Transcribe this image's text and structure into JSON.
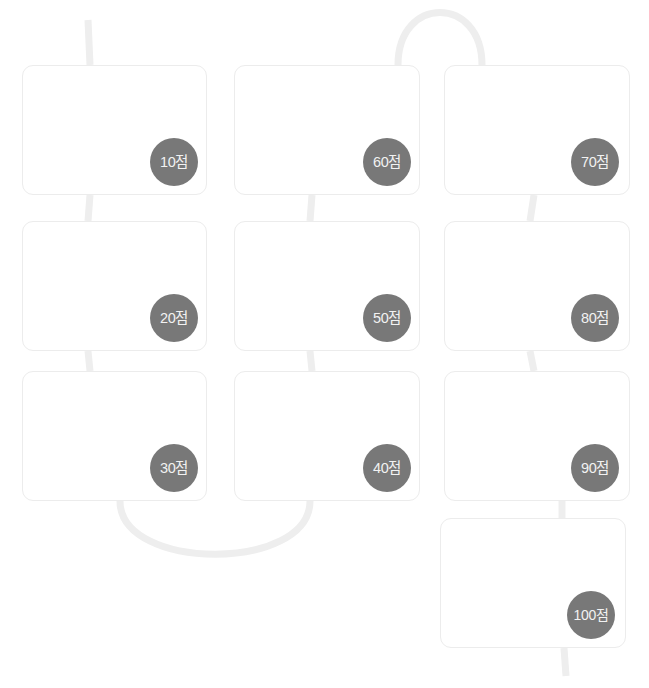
{
  "board": {
    "title": "score-card-flow-board",
    "colors": {
      "card_background": "#ffffff",
      "card_border": "#ececec",
      "connector": "#eeeeee",
      "badge_background": "#787878",
      "badge_text": "#f2f2f2",
      "page_background": "#ffffff"
    },
    "cards": [
      {
        "id": "card-1",
        "score_label": "10점",
        "x": 22,
        "y": 65,
        "w": 185,
        "h": 130,
        "badge_w": 48,
        "badge_h": 48,
        "badge_right": 8,
        "badge_bottom": 8
      },
      {
        "id": "card-2",
        "score_label": "60점",
        "x": 234,
        "y": 65,
        "w": 186,
        "h": 130,
        "badge_w": 48,
        "badge_h": 48,
        "badge_right": 8,
        "badge_bottom": 8
      },
      {
        "id": "card-3",
        "score_label": "70점",
        "x": 444,
        "y": 65,
        "w": 186,
        "h": 130,
        "badge_w": 48,
        "badge_h": 48,
        "badge_right": 10,
        "badge_bottom": 8
      },
      {
        "id": "card-4",
        "score_label": "20점",
        "x": 22,
        "y": 221,
        "w": 185,
        "h": 130,
        "badge_w": 48,
        "badge_h": 48,
        "badge_right": 8,
        "badge_bottom": 8
      },
      {
        "id": "card-5",
        "score_label": "50점",
        "x": 234,
        "y": 221,
        "w": 186,
        "h": 130,
        "badge_w": 48,
        "badge_h": 48,
        "badge_right": 8,
        "badge_bottom": 8
      },
      {
        "id": "card-6",
        "score_label": "80점",
        "x": 444,
        "y": 221,
        "w": 186,
        "h": 130,
        "badge_w": 48,
        "badge_h": 48,
        "badge_right": 10,
        "badge_bottom": 8
      },
      {
        "id": "card-7",
        "score_label": "30점",
        "x": 22,
        "y": 371,
        "w": 185,
        "h": 130,
        "badge_w": 48,
        "badge_h": 48,
        "badge_right": 8,
        "badge_bottom": 8
      },
      {
        "id": "card-8",
        "score_label": "40점",
        "x": 234,
        "y": 371,
        "w": 186,
        "h": 130,
        "badge_w": 48,
        "badge_h": 48,
        "badge_right": 8,
        "badge_bottom": 8
      },
      {
        "id": "card-9",
        "score_label": "90점",
        "x": 444,
        "y": 371,
        "w": 186,
        "h": 130,
        "badge_w": 48,
        "badge_h": 48,
        "badge_right": 10,
        "badge_bottom": 8
      },
      {
        "id": "card-10",
        "score_label": "100점",
        "x": 440,
        "y": 518,
        "w": 186,
        "h": 130,
        "badge_w": 48,
        "badge_h": 48,
        "badge_right": 10,
        "badge_bottom": 8
      }
    ],
    "connectors": [
      {
        "id": "entry-stub",
        "kind": "line",
        "d": "M 88 20 L 90 65"
      },
      {
        "id": "link-10-to-20",
        "kind": "line",
        "d": "M 90 195 L 88 221"
      },
      {
        "id": "link-20-to-30",
        "kind": "line",
        "d": "M 88 351 L 90 371"
      },
      {
        "id": "arc-30-to-40",
        "kind": "arc",
        "d": "M 120 501 C 120 572, 310 572, 310 501"
      },
      {
        "id": "link-40-to-50",
        "kind": "line",
        "d": "M 312 371 L 310 351"
      },
      {
        "id": "link-50-to-60",
        "kind": "line",
        "d": "M 310 221 L 312 195"
      },
      {
        "id": "arc-60-to-70",
        "kind": "arc",
        "d": "M 398 65 C 398 -5, 482 -5, 482 65"
      },
      {
        "id": "link-70-to-80",
        "kind": "line",
        "d": "M 534 195 L 530 221"
      },
      {
        "id": "link-80-to-90",
        "kind": "line",
        "d": "M 530 351 L 534 371"
      },
      {
        "id": "link-90-to-100",
        "kind": "line",
        "d": "M 562 501 L 562 518"
      },
      {
        "id": "exit-stub",
        "kind": "line",
        "d": "M 564 648 L 566 676"
      }
    ]
  }
}
